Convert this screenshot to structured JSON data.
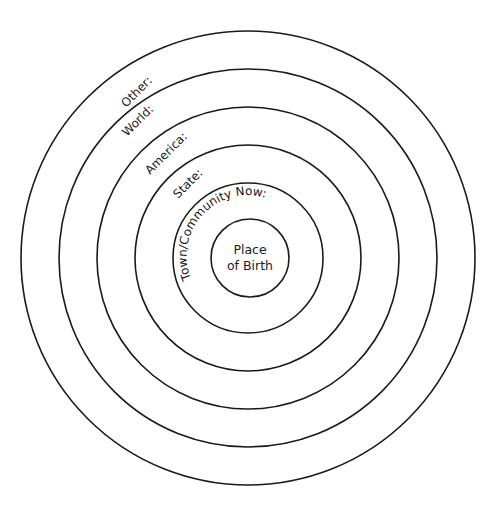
{
  "diagram": {
    "center": {
      "x": 248,
      "y": 258
    },
    "line_color": "#1a1a1a",
    "background": "#ffffff",
    "rings": [
      {
        "id": "other",
        "label": "Other:",
        "radius": 227
      },
      {
        "id": "world",
        "label": "World:",
        "radius": 189
      },
      {
        "id": "america",
        "label": "America:",
        "radius": 151
      },
      {
        "id": "state",
        "label": "State:",
        "radius": 113
      },
      {
        "id": "town",
        "label": "Town/Community Now:",
        "radius": 75
      },
      {
        "id": "birth",
        "label": "",
        "radius": 38
      }
    ],
    "center_label": {
      "line1": "Place",
      "line2": "of Birth"
    }
  }
}
